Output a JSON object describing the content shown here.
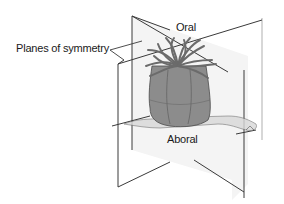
{
  "figure": {
    "labels": {
      "planes": "Planes of symmetry",
      "oral": "Oral",
      "aboral": "Aboral"
    },
    "colors": {
      "line": "#3a3a3a",
      "plane_fill": "#f0f0f0",
      "body": "#8c8c8c",
      "body_dark": "#5e5e5e",
      "tentacle": "#6b6b6b"
    }
  }
}
